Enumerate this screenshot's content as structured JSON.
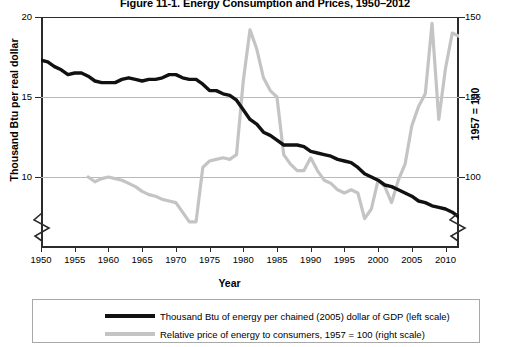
{
  "title": "Figure 11-1. Energy Consumption and Prices, 1950–2012",
  "axes": {
    "xlabel": "Year",
    "ylabel_left": "Thousand Btu per real dollar",
    "ylabel_right": "1957 = 100",
    "xticks": [
      "1950",
      "1955",
      "1960",
      "1965",
      "1970",
      "1975",
      "1980",
      "1985",
      "1990",
      "1995",
      "2000",
      "2005",
      "2010"
    ],
    "yticks_left": [
      "20",
      "15",
      "10"
    ],
    "yticks_right": [
      "150",
      "125",
      "100"
    ]
  },
  "legend": {
    "items": [
      {
        "label": "Thousand Btu of energy per chained (2005) dollar of GDP (left scale)",
        "color": "#111111"
      },
      {
        "label": "Relative price of energy to consumers, 1957 = 100 (right scale)",
        "color": "#c4c4c4"
      }
    ]
  },
  "chart_data": {
    "type": "line",
    "title": "Figure 11-1. Energy Consumption and Prices, 1950–2012",
    "xlabel": "Year",
    "ylabel": "Thousand Btu per real dollar",
    "ylabel_right": "1957 = 100",
    "xlim": [
      1950,
      2012
    ],
    "ylim_left": [
      7.5,
      20
    ],
    "ylim_right": [
      81,
      150
    ],
    "yticks_left": [
      10,
      15,
      20
    ],
    "yticks_right": [
      100,
      125,
      150
    ],
    "grid": "horizontal",
    "axis_break_left": true,
    "axis_break_right": true,
    "legend_position": "bottom",
    "series": [
      {
        "name": "Thousand Btu of energy per chained (2005) dollar of GDP (left scale)",
        "axis": "left",
        "color": "#111111",
        "x": [
          1950,
          1951,
          1952,
          1953,
          1954,
          1955,
          1956,
          1957,
          1958,
          1959,
          1960,
          1961,
          1962,
          1963,
          1964,
          1965,
          1966,
          1967,
          1968,
          1969,
          1970,
          1971,
          1972,
          1973,
          1974,
          1975,
          1976,
          1977,
          1978,
          1979,
          1980,
          1981,
          1982,
          1983,
          1984,
          1985,
          1986,
          1987,
          1988,
          1989,
          1990,
          1991,
          1992,
          1993,
          1994,
          1995,
          1996,
          1997,
          1998,
          1999,
          2000,
          2001,
          2002,
          2003,
          2004,
          2005,
          2006,
          2007,
          2008,
          2009,
          2010,
          2011,
          2012
        ],
        "y": [
          17.3,
          17.2,
          16.9,
          16.7,
          16.4,
          16.5,
          16.5,
          16.3,
          16.0,
          15.9,
          15.9,
          15.9,
          16.1,
          16.2,
          16.1,
          16.0,
          16.1,
          16.1,
          16.2,
          16.4,
          16.4,
          16.2,
          16.1,
          16.1,
          15.8,
          15.4,
          15.4,
          15.2,
          15.1,
          14.8,
          14.2,
          13.6,
          13.3,
          12.8,
          12.6,
          12.3,
          12.0,
          12.0,
          12.0,
          11.9,
          11.6,
          11.5,
          11.4,
          11.3,
          11.1,
          11.0,
          10.9,
          10.6,
          10.2,
          10.0,
          9.8,
          9.5,
          9.4,
          9.2,
          9.0,
          8.8,
          8.5,
          8.4,
          8.2,
          8.1,
          8.0,
          7.8,
          7.5
        ]
      },
      {
        "name": "Relative price of energy to consumers, 1957 = 100 (right scale)",
        "axis": "right",
        "color": "#c4c4c4",
        "x": [
          1957,
          1958,
          1959,
          1960,
          1961,
          1962,
          1963,
          1964,
          1965,
          1966,
          1967,
          1968,
          1969,
          1970,
          1971,
          1972,
          1973,
          1974,
          1975,
          1976,
          1977,
          1978,
          1979,
          1980,
          1981,
          1982,
          1983,
          1984,
          1985,
          1986,
          1987,
          1988,
          1989,
          1990,
          1991,
          1992,
          1993,
          1994,
          1995,
          1996,
          1997,
          1998,
          1999,
          2000,
          2001,
          2002,
          2003,
          2004,
          2005,
          2006,
          2007,
          2008,
          2009,
          2010,
          2011,
          2012
        ],
        "y": [
          100,
          98.5,
          99.5,
          100,
          99.5,
          99,
          98,
          97,
          95.5,
          94.5,
          94,
          93,
          92.5,
          92,
          89,
          86,
          86,
          103,
          105,
          105.5,
          106,
          105.5,
          107,
          130,
          146,
          140,
          131,
          127,
          125,
          107,
          104,
          102,
          102,
          106,
          102,
          99,
          98,
          96,
          95,
          96,
          95,
          87,
          90,
          99,
          97,
          92,
          99,
          104,
          116,
          122,
          126,
          148,
          118,
          134,
          145,
          144
        ]
      }
    ]
  }
}
